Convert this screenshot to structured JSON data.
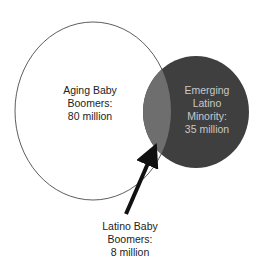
{
  "diagram": {
    "type": "venn",
    "sets": [
      {
        "name": "aging-baby-boomers",
        "lines": [
          "Aging Baby",
          "Boomers:",
          "80 million"
        ],
        "fill": "#ffffff",
        "stroke": "#333333"
      },
      {
        "name": "emerging-latino-minority",
        "lines": [
          "Emerging",
          "Latino",
          "Minority:",
          "35 million"
        ],
        "fill": "#3f3f3f",
        "text_color": "#c8c8c8"
      }
    ],
    "intersection": {
      "name": "latino-baby-boomers",
      "lines": [
        "Latino Baby",
        "Boomers:",
        "8 million"
      ],
      "fill": "#6e6e6e"
    }
  }
}
